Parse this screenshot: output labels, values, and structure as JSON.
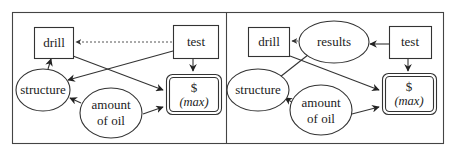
{
  "diagrams": [
    {
      "name": "influence-diagram-without-results",
      "nodes": {
        "drill": {
          "label": "drill",
          "shape": "rectangle",
          "type": "decision"
        },
        "test": {
          "label": "test",
          "shape": "rectangle",
          "type": "decision"
        },
        "value": {
          "label_line1": "$",
          "label_line2": "(max)",
          "shape": "double-rounded-rectangle",
          "type": "value"
        },
        "structure": {
          "label": "structure",
          "shape": "ellipse",
          "type": "chance"
        },
        "amount_of_oil": {
          "label_line1": "amount",
          "label_line2": "of oil",
          "shape": "ellipse",
          "type": "chance"
        }
      },
      "edges": [
        {
          "from": "test",
          "to": "drill",
          "style": "dotted"
        },
        {
          "from": "structure",
          "to": "drill",
          "style": "solid"
        },
        {
          "from": "test",
          "to": "structure",
          "style": "solid"
        },
        {
          "from": "drill",
          "to": "value",
          "style": "solid"
        },
        {
          "from": "test",
          "to": "value",
          "style": "solid"
        },
        {
          "from": "amount_of_oil",
          "to": "structure",
          "style": "solid"
        },
        {
          "from": "amount_of_oil",
          "to": "value",
          "style": "solid"
        }
      ]
    },
    {
      "name": "influence-diagram-with-results",
      "nodes": {
        "drill": {
          "label": "drill",
          "shape": "rectangle",
          "type": "decision"
        },
        "results": {
          "label": "results",
          "shape": "ellipse",
          "type": "chance"
        },
        "test": {
          "label": "test",
          "shape": "rectangle",
          "type": "decision"
        },
        "value": {
          "label_line1": "$",
          "label_line2": "(max)",
          "shape": "double-rounded-rectangle",
          "type": "value"
        },
        "structure": {
          "label": "structure",
          "shape": "ellipse",
          "type": "chance"
        },
        "amount_of_oil": {
          "label_line1": "amount",
          "label_line2": "of oil",
          "shape": "ellipse",
          "type": "chance"
        }
      },
      "edges": [
        {
          "from": "results",
          "to": "drill",
          "style": "dotted"
        },
        {
          "from": "test",
          "to": "results",
          "style": "solid"
        },
        {
          "from": "structure",
          "to": "results",
          "style": "solid"
        },
        {
          "from": "drill",
          "to": "value",
          "style": "solid"
        },
        {
          "from": "test",
          "to": "value",
          "style": "solid"
        },
        {
          "from": "amount_of_oil",
          "to": "structure",
          "style": "solid"
        },
        {
          "from": "amount_of_oil",
          "to": "value",
          "style": "solid"
        }
      ]
    }
  ]
}
